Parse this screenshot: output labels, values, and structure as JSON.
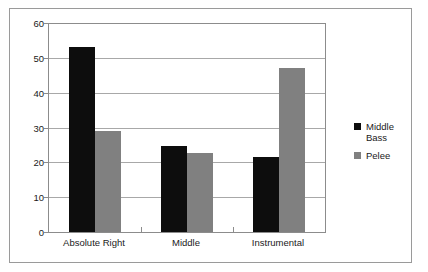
{
  "chart_data": {
    "type": "bar",
    "title": "",
    "subtitle": "",
    "xlabel": "",
    "ylabel": "",
    "categories": [
      "Absolute Right",
      "Middle",
      "Instrumental"
    ],
    "series": [
      {
        "name": "Middle Bass",
        "values": [
          53,
          24.8,
          21.5
        ],
        "color": "#0d0d0d"
      },
      {
        "name": "Pelee",
        "values": [
          29,
          22.7,
          47
        ],
        "color": "#808080"
      }
    ],
    "ylim": [
      0,
      60
    ],
    "yticks": [
      0,
      10,
      20,
      30,
      40,
      50,
      60
    ],
    "ytick_labels": [
      "0",
      "10",
      "20",
      "30",
      "40",
      "50",
      "60"
    ],
    "grid": true,
    "grid_axis": "y",
    "legend_position": "right",
    "frame": true,
    "background": "#ffffff",
    "axis_color": "#8c8c8c",
    "grid_color": "#a8a8a8",
    "text_color": "#1a1a1a"
  },
  "legend": {
    "entries": [
      {
        "label": "Middle\nBass",
        "color": "#0d0d0d"
      },
      {
        "label": "Pelee",
        "color": "#808080"
      }
    ]
  }
}
